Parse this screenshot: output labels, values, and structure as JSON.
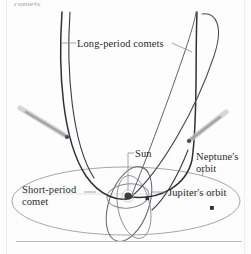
{
  "figure": {
    "caption_fragment": "comets",
    "background_color": "#fdfdfd",
    "labels": {
      "long_period_comets": "Long-period comets",
      "sun": "Sun",
      "neptune_orbit": "Neptune's orbit",
      "short_period_comet": "Short-period comet",
      "jupiter_orbit": "Jupiter's orbit"
    },
    "colors": {
      "orbit_dark": "#2f2f33",
      "orbit_light": "#9c9aa0",
      "comet_tail": "#b9b9bd",
      "label_text": "#2b2b2b",
      "rule": "#b8b8b8",
      "frame": "#e2e2e2"
    },
    "elements": {
      "sun_marker": "sun-dot",
      "neptune_marker": "neptune-dot",
      "jupiter_marker": "jupiter-dot",
      "comet_left": "comet-with-tail",
      "comet_right": "comet-with-tail"
    }
  }
}
